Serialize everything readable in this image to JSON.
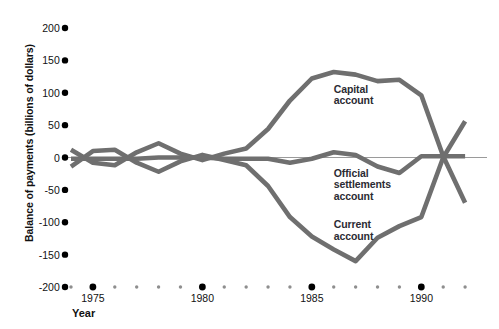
{
  "chart_data": {
    "type": "line",
    "title": "",
    "subtitle": "",
    "xlabel": "Year",
    "ylabel": "Balance of payments (billions of dollars)",
    "xlim": [
      1974,
      1993
    ],
    "ylim": [
      -200,
      200
    ],
    "grid": false,
    "legend_position": "inline-annotations",
    "y_ticks": [
      200,
      150,
      100,
      50,
      0,
      -50,
      -100,
      -150,
      -200
    ],
    "y_tick_labels": [
      "200",
      "150",
      "100",
      "50",
      "0",
      "-50",
      "-100",
      "-150",
      "-200"
    ],
    "x_ticks": [
      1974,
      1975,
      1976,
      1977,
      1978,
      1979,
      1980,
      1981,
      1982,
      1983,
      1984,
      1985,
      1986,
      1987,
      1988,
      1989,
      1990,
      1991,
      1992
    ],
    "x_major_ticks": [
      1975,
      1980,
      1985,
      1990
    ],
    "x_tick_labels": [
      "1975",
      "1980",
      "1985",
      "1990"
    ],
    "x": [
      1974,
      1975,
      1976,
      1977,
      1978,
      1979,
      1980,
      1981,
      1982,
      1983,
      1984,
      1985,
      1986,
      1987,
      1988,
      1989,
      1990,
      1991,
      1992
    ],
    "series": [
      {
        "name": "Capital account",
        "color": "#6f6f6f",
        "values": [
          12,
          -8,
          -12,
          8,
          22,
          6,
          -4,
          6,
          14,
          44,
          88,
          122,
          132,
          128,
          118,
          120,
          96,
          2,
          -70
        ]
      },
      {
        "name": "Current account",
        "color": "#6f6f6f",
        "values": [
          -14,
          10,
          12,
          -8,
          -22,
          -6,
          4,
          -4,
          -12,
          -44,
          -92,
          -122,
          -142,
          -160,
          -124,
          -106,
          -92,
          0,
          56
        ]
      },
      {
        "name": "Official settlements account",
        "color": "#6f6f6f",
        "values": [
          -2,
          -2,
          -2,
          -2,
          0,
          0,
          0,
          -2,
          -2,
          -2,
          -8,
          -2,
          8,
          4,
          -14,
          -24,
          2,
          2,
          2
        ]
      }
    ],
    "annotations": [
      {
        "text_line1": "Capital",
        "text_line2": "account",
        "x": 1986,
        "y": 105
      },
      {
        "text_line1": "Official",
        "text_line2": "settlements",
        "text_line3": "account",
        "x": 1986,
        "y": -25
      },
      {
        "text_line1": "Current",
        "text_line2": "account",
        "x": 1986,
        "y": -105
      }
    ],
    "tick_marker_style": "dot",
    "zero_line": true,
    "axis_color": "#000000"
  }
}
